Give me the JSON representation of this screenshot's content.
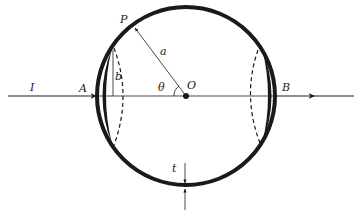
{
  "diagram": {
    "labels": {
      "current": "I",
      "entry_point": "A",
      "exit_point": "B",
      "point_on_shell": "P",
      "radius": "a",
      "radius_small": "b",
      "angle": "θ",
      "center": "O",
      "thickness": "t"
    },
    "colors": {
      "ink": "#1a1a1a",
      "background": "#ffffff"
    }
  }
}
